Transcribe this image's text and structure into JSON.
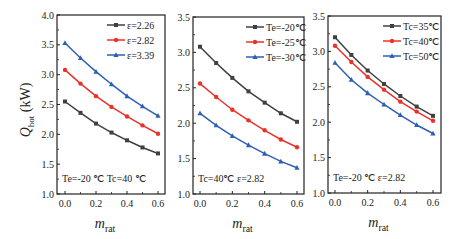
{
  "chart_data": [
    {
      "type": "line",
      "title": "",
      "xlabel": "m_rat",
      "ylabel": "Q_hot (kW)",
      "xlim": [
        0.0,
        0.6
      ],
      "ylim": [
        1.0,
        4.0
      ],
      "xticks": [
        "0.0",
        "0.2",
        "0.4",
        "0.6"
      ],
      "yticks": [
        "1.0",
        "1.5",
        "2.0",
        "2.5",
        "3.0",
        "3.5",
        "4.0"
      ],
      "x": [
        0.0,
        0.1,
        0.2,
        0.3,
        0.4,
        0.5,
        0.6
      ],
      "annotation": "Te=-20 ℃  Tc=40 ℃",
      "legend_position": "upper right",
      "series": [
        {
          "name": "ε=2.26",
          "color": "#404040",
          "marker": "square",
          "values": [
            2.55,
            2.36,
            2.18,
            2.03,
            1.9,
            1.78,
            1.68
          ]
        },
        {
          "name": "ε=2.82",
          "color": "#e8332a",
          "marker": "circle",
          "values": [
            3.08,
            2.85,
            2.64,
            2.46,
            2.3,
            2.15,
            2.01
          ]
        },
        {
          "name": "ε=3.39",
          "color": "#2f5fb3",
          "marker": "triangle",
          "values": [
            3.53,
            3.28,
            3.05,
            2.84,
            2.64,
            2.47,
            2.31
          ]
        }
      ]
    },
    {
      "type": "line",
      "title": "",
      "xlabel": "m_rat",
      "ylabel": "",
      "xlim": [
        0.0,
        0.6
      ],
      "ylim": [
        1.0,
        3.5
      ],
      "xticks": [
        "0.0",
        "0.2",
        "0.4",
        "0.6"
      ],
      "yticks": [
        "1.0",
        "1.5",
        "2.0",
        "2.5",
        "3.0",
        "3.5"
      ],
      "x": [
        0.0,
        0.1,
        0.2,
        0.3,
        0.4,
        0.5,
        0.6
      ],
      "annotation": "Tc=40℃  ε=2.82",
      "legend_position": "upper right",
      "series": [
        {
          "name": "Te=-20℃",
          "color": "#404040",
          "marker": "square",
          "values": [
            3.08,
            2.85,
            2.64,
            2.45,
            2.29,
            2.14,
            2.02
          ]
        },
        {
          "name": "Te=-25℃",
          "color": "#e8332a",
          "marker": "circle",
          "values": [
            2.56,
            2.37,
            2.19,
            2.04,
            1.9,
            1.77,
            1.66
          ]
        },
        {
          "name": "Te=-30℃",
          "color": "#2f5fb3",
          "marker": "triangle",
          "values": [
            2.14,
            1.97,
            1.82,
            1.69,
            1.57,
            1.46,
            1.37
          ]
        }
      ]
    },
    {
      "type": "line",
      "title": "",
      "xlabel": "m_rat",
      "ylabel": "",
      "xlim": [
        0.0,
        0.6
      ],
      "ylim": [
        1.0,
        3.5
      ],
      "xticks": [
        "0.0",
        "0.2",
        "0.4",
        "0.6"
      ],
      "yticks": [
        "1.0",
        "1.5",
        "2.0",
        "2.5",
        "3.0",
        "3.5"
      ],
      "x": [
        0.0,
        0.1,
        0.2,
        0.3,
        0.4,
        0.5,
        0.6
      ],
      "annotation": "Te=-20 ℃  ε=2.82",
      "legend_position": "upper right",
      "series": [
        {
          "name": "Tc=35℃",
          "color": "#404040",
          "marker": "square",
          "values": [
            3.2,
            2.95,
            2.73,
            2.54,
            2.37,
            2.22,
            2.09
          ]
        },
        {
          "name": "Tc=40℃",
          "color": "#e8332a",
          "marker": "circle",
          "values": [
            3.08,
            2.85,
            2.64,
            2.46,
            2.29,
            2.15,
            2.02
          ]
        },
        {
          "name": "Tc=50℃",
          "color": "#2f5fb3",
          "marker": "triangle",
          "values": [
            2.84,
            2.6,
            2.41,
            2.25,
            2.1,
            1.96,
            1.84
          ]
        }
      ]
    }
  ],
  "labels": {
    "ylabel_main": "Q",
    "ylabel_sub": "hot",
    "ylabel_unit": " (kW)",
    "xlabel_main": "m",
    "xlabel_sub": "rat"
  }
}
